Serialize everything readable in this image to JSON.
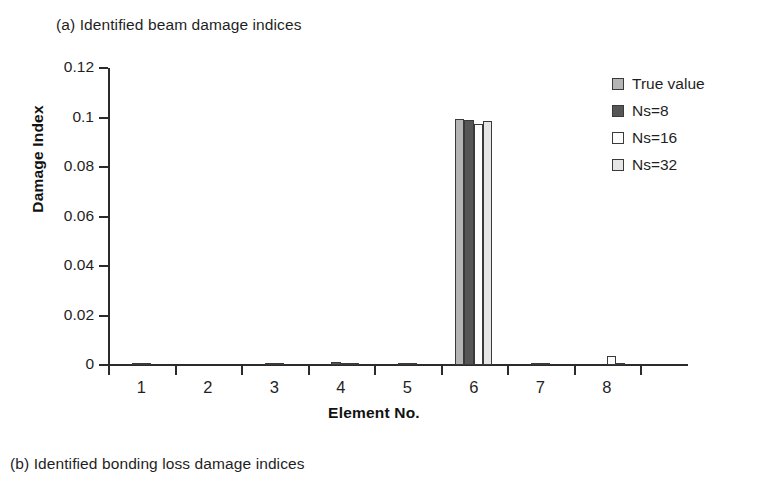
{
  "figure": {
    "caption_a": "(a) Identified beam damage indices",
    "caption_b": "(b) Identified bonding loss  damage indices"
  },
  "chart_data": {
    "type": "bar",
    "title": "(a) Identified beam damage indices",
    "xlabel": "Element No.",
    "ylabel": "Damage Index",
    "categories": [
      "1",
      "2",
      "3",
      "4",
      "5",
      "6",
      "7",
      "8"
    ],
    "ylim": [
      0,
      0.12
    ],
    "yticks": [
      0,
      0.02,
      0.04,
      0.06,
      0.08,
      0.1,
      0.12
    ],
    "ytick_labels": [
      "0",
      "0.02",
      "0.04",
      "0.06",
      "0.08",
      "0.1",
      "0.12"
    ],
    "grid": false,
    "legend_position": "top-right",
    "series": [
      {
        "name": "True value",
        "color": "#b5b5b5",
        "values": [
          0.0,
          0.0,
          0.0,
          0.0,
          0.0,
          0.0995,
          0.0,
          0.0
        ]
      },
      {
        "name": "Ns=8",
        "color": "#565656",
        "values": [
          0.0005,
          0.0,
          0.0005,
          0.0012,
          0.0004,
          0.099,
          0.0004,
          0.0
        ]
      },
      {
        "name": "Ns=16",
        "color": "#fdfdfd",
        "values": [
          0.0003,
          0.0,
          0.0003,
          0.0005,
          0.0002,
          0.0975,
          0.0005,
          0.0035
        ]
      },
      {
        "name": "Ns=32",
        "color": "#e6e6e6",
        "values": [
          0.0,
          0.0,
          0.0,
          0.0003,
          0.0,
          0.0985,
          0.0,
          0.0004
        ]
      }
    ]
  }
}
